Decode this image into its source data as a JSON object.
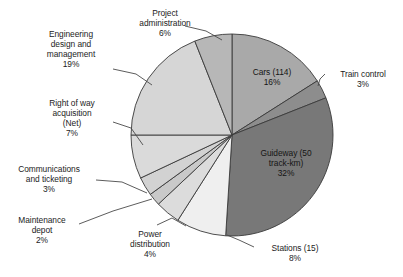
{
  "chart_data": {
    "type": "pie",
    "title": "",
    "subtitle": "",
    "xlabel": "",
    "ylabel": "",
    "legend_position": "none",
    "grid": false,
    "units": "percent",
    "total": 100,
    "start_angle_deg": 0,
    "direction": "clockwise",
    "categories": [
      "Cars (114)",
      "Train control",
      "Guideway (50 track-km)",
      "Stations (15)",
      "Power distribution",
      "Maintenance depot",
      "Communications and ticketing",
      "Right of way acquisition (Net)",
      "Engineering design and management",
      "Project administration"
    ],
    "values": [
      16,
      3,
      32,
      8,
      4,
      2,
      3,
      7,
      19,
      6
    ],
    "colors": [
      "#a9a9a9",
      "#8d8d8d",
      "#787878",
      "#efefef",
      "#dcdcdc",
      "#c9c9c9",
      "#d2d2d2",
      "#dadada",
      "#d6d6d6",
      "#b7b7b7"
    ],
    "slices": [
      {
        "name": "cars",
        "label": "Cars (114)",
        "percent_text": "16%",
        "value": 16,
        "color": "#a9a9a9",
        "label_placement": "inside"
      },
      {
        "name": "train-control",
        "label": "Train control",
        "percent_text": "3%",
        "value": 3,
        "color": "#8d8d8d",
        "label_placement": "outside"
      },
      {
        "name": "guideway",
        "label": "Guideway (50 track-km)",
        "percent_text": "32%",
        "value": 32,
        "color": "#787878",
        "label_placement": "inside"
      },
      {
        "name": "stations",
        "label": "Stations (15)",
        "percent_text": "8%",
        "value": 8,
        "color": "#efefef",
        "label_placement": "outside"
      },
      {
        "name": "power-distribution",
        "label": "Power distribution",
        "percent_text": "4%",
        "value": 4,
        "color": "#dcdcdc",
        "label_placement": "outside"
      },
      {
        "name": "maintenance-depot",
        "label": "Maintenance depot",
        "percent_text": "2%",
        "value": 2,
        "color": "#c9c9c9",
        "label_placement": "outside"
      },
      {
        "name": "communications-and-ticketing",
        "label": "Communications and ticketing",
        "percent_text": "3%",
        "value": 3,
        "color": "#d2d2d2",
        "label_placement": "outside"
      },
      {
        "name": "right-of-way-acquisition",
        "label": "Right of way acquisition (Net)",
        "percent_text": "7%",
        "value": 7,
        "color": "#dadada",
        "label_placement": "outside"
      },
      {
        "name": "engineering-design-and-management",
        "label": "Engineering design and management",
        "percent_text": "19%",
        "value": 19,
        "color": "#d6d6d6",
        "label_placement": "outside"
      },
      {
        "name": "project-administration",
        "label": "Project administration",
        "percent_text": "6%",
        "value": 6,
        "color": "#b7b7b7",
        "label_placement": "outside"
      }
    ]
  },
  "labels": {
    "project_administration": "Project\nadministration\n6%",
    "engineering": "Engineering\ndesign and\nmanagement\n19%",
    "right_of_way": "Right of way\nacquisition\n(Net)\n7%",
    "communications": "Communications\nand ticketing\n3%",
    "maintenance_depot": "Maintenance\ndepot\n2%",
    "power_distribution": "Power\ndistribution\n4%",
    "stations": "Stations (15)\n8%",
    "train_control": "Train control\n3%",
    "cars": "Cars (114)\n16%",
    "guideway": "Guideway (50\ntrack-km)\n32%"
  }
}
